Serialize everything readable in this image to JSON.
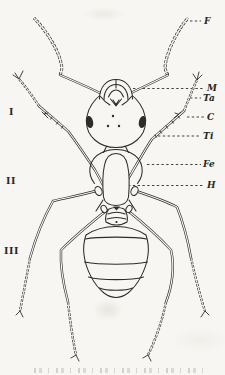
{
  "figure": {
    "ink_color": "#2e2c28",
    "paper_color": "#f7f6f2",
    "part_labels": [
      {
        "abbr": "F"
      },
      {
        "abbr": "M"
      },
      {
        "abbr": "Ta"
      },
      {
        "abbr": "C"
      },
      {
        "abbr": "Ti"
      },
      {
        "abbr": "Fe"
      },
      {
        "abbr": "H"
      }
    ],
    "segment_numerals": [
      {
        "numeral": "I"
      },
      {
        "numeral": "II"
      },
      {
        "numeral": "III"
      }
    ]
  }
}
